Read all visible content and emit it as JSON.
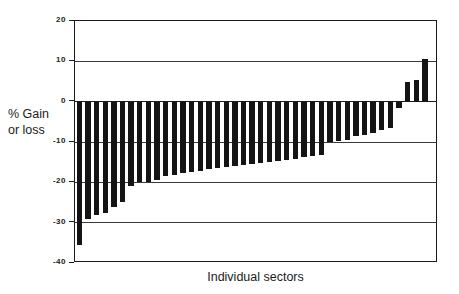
{
  "chart_data": {
    "type": "bar",
    "title": "",
    "xlabel": "Individual sectors",
    "ylabel_lines": [
      "% Gain",
      "or loss"
    ],
    "ylabel": "% Gain or loss",
    "ylim": [
      -40,
      20
    ],
    "yticks": [
      20,
      10,
      0,
      -10,
      -20,
      -30,
      -40
    ],
    "ytick_labels": [
      "20",
      "10",
      "0",
      "-10",
      "-20",
      "-30",
      "-40"
    ],
    "grid": true,
    "legend": "none",
    "bar_color": "#141414",
    "axis_color": "#1b1b1b",
    "categories": [
      "1",
      "2",
      "3",
      "4",
      "5",
      "6",
      "7",
      "8",
      "9",
      "10",
      "11",
      "12",
      "13",
      "14",
      "15",
      "16",
      "17",
      "18",
      "19",
      "20",
      "21",
      "22",
      "23",
      "24",
      "25",
      "26",
      "27",
      "28",
      "29",
      "30",
      "31",
      "32",
      "33",
      "34",
      "35",
      "36",
      "37",
      "38",
      "39",
      "40",
      "41",
      "42"
    ],
    "values": [
      -35.5,
      -29.0,
      -28.0,
      -27.5,
      -26.0,
      -25.0,
      -21.0,
      -20.0,
      -19.8,
      -19.5,
      -18.5,
      -18.2,
      -17.8,
      -17.5,
      -17.2,
      -16.8,
      -16.5,
      -16.2,
      -16.0,
      -15.8,
      -15.5,
      -15.2,
      -15.0,
      -14.8,
      -14.5,
      -14.2,
      -13.8,
      -13.5,
      -13.2,
      -10.0,
      -9.8,
      -9.5,
      -8.5,
      -8.2,
      -7.8,
      -7.0,
      -6.5,
      -1.5,
      5.0,
      5.3,
      10.5,
      0
    ]
  }
}
